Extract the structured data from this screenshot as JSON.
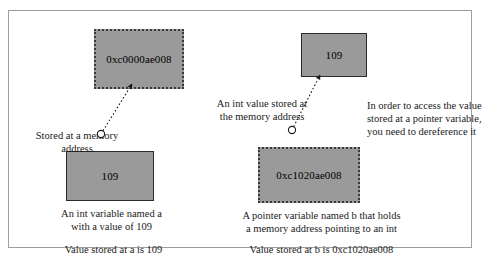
{
  "figure": {
    "frame_border_color": "#9d9d9d",
    "block_fill_color": "#9a9a9a"
  },
  "left_example": {
    "address_block_value": "0xc0000ae008",
    "variable_block_value": "109",
    "pointer_label": "Stored at a memory\naddress",
    "variable_description": "An int variable named a\nwith a value of 109",
    "summary": "Value stored at a is 109"
  },
  "right_example": {
    "value_block_value": "109",
    "address_block_value": "0xc1020ae008",
    "pointer_label": "An int value stored at\nthe memory address",
    "dereference_note": "In order to access the value\nstored at a pointer variable,\nyou need to dereference it",
    "variable_description": "A pointer variable named b that holds\na memory address pointing to an int",
    "summary": "Value stored at b is 0xc1020ae008"
  }
}
